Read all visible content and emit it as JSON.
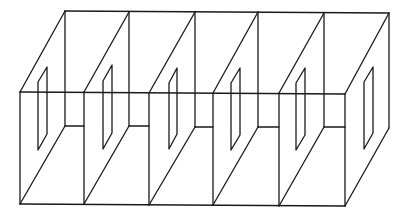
{
  "diagram": {
    "title": "",
    "compartments": 5,
    "stroke_color": "#1a1a1a",
    "background": "#ffffff"
  }
}
